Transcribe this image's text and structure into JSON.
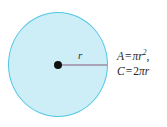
{
  "figure": {
    "name": "circle-area-circumference-figure",
    "background_color": "#ffffff",
    "circle": {
      "fill_color": "#cdeef7",
      "stroke_color": "#4fc6e4",
      "center_dot_color": "#111111"
    },
    "radius": {
      "label": "r",
      "line_color": "#a9a3b8"
    },
    "formulas": {
      "area": {
        "lhs": "A",
        "equals": "=",
        "pi": "π",
        "variable": "r",
        "exponent": "2",
        "trailing": ","
      },
      "circumference": {
        "lhs": "C",
        "equals": "=",
        "coefficient": "2",
        "pi": "π",
        "variable": "r"
      }
    }
  }
}
